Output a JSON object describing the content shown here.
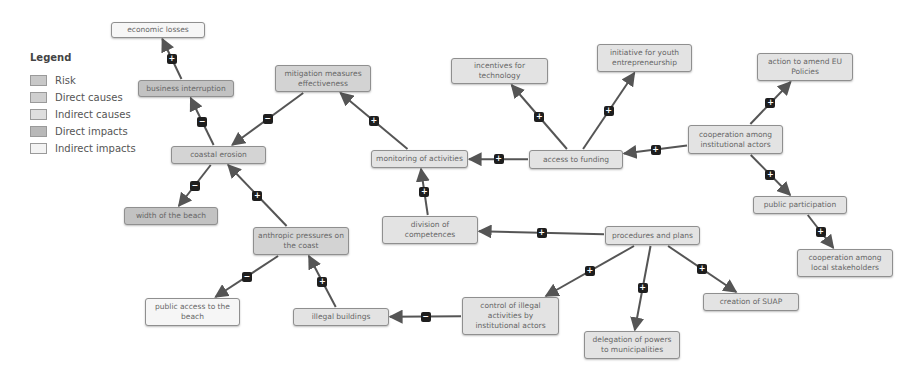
{
  "legend": {
    "title": "Legend",
    "items": [
      {
        "label": "Risk",
        "color": "#c8c8c8"
      },
      {
        "label": "Direct causes",
        "color": "#cfcfcf"
      },
      {
        "label": "Indirect causes",
        "color": "#dedede"
      },
      {
        "label": "Direct impacts",
        "color": "#b8b8b8"
      },
      {
        "label": "Indirect impacts",
        "color": "#f3f3f3"
      }
    ]
  },
  "nodes": {
    "economic_losses": {
      "label": "economic losses",
      "category": "Indirect impacts"
    },
    "business_interruption": {
      "label": "business interruption",
      "category": "Direct impacts"
    },
    "coastal_erosion": {
      "label": "coastal erosion",
      "category": "Risk"
    },
    "width_of_the_beach": {
      "label": "width of the beach",
      "category": "Direct impacts"
    },
    "mitigation_measures_effectiveness": {
      "label": "mitigation measures effectiveness",
      "category": "Direct causes"
    },
    "anthropic_pressures": {
      "label": "anthropic pressures on the coast",
      "category": "Direct causes"
    },
    "public_access_to_the_beach": {
      "label": "public access to the beach",
      "category": "Indirect impacts"
    },
    "illegal_buildings": {
      "label": "illegal buildings",
      "category": "Indirect causes"
    },
    "monitoring_of_activities": {
      "label": "monitoring of activities",
      "category": "Indirect causes"
    },
    "division_of_competences": {
      "label": "division of competences",
      "category": "Indirect causes"
    },
    "access_to_funding": {
      "label": "access to funding",
      "category": "Indirect causes"
    },
    "incentives_for_technology": {
      "label": "incentives for technology",
      "category": "Indirect causes"
    },
    "initiative_for_youth": {
      "label": "initiative for youth entrepreneurship",
      "category": "Indirect causes"
    },
    "cooperation_institutional": {
      "label": "cooperation among institutional actors",
      "category": "Indirect causes"
    },
    "action_to_amend_eu": {
      "label": "action to amend EU Policies",
      "category": "Indirect causes"
    },
    "public_participation": {
      "label": "public participation",
      "category": "Indirect causes"
    },
    "cooperation_local": {
      "label": "cooperation among local stakeholders",
      "category": "Indirect causes"
    },
    "procedures_and_plans": {
      "label": "procedures and plans",
      "category": "Indirect causes"
    },
    "control_of_illegal": {
      "label": "control of illegal activities by institutional actors",
      "category": "Indirect causes"
    },
    "delegation_of_powers": {
      "label": "delegation of powers to municipalities",
      "category": "Indirect causes"
    },
    "creation_of_suap": {
      "label": "creation of SUAP",
      "category": "Indirect causes"
    }
  },
  "edges": [
    {
      "from": "business_interruption",
      "to": "economic_losses",
      "sign": "+"
    },
    {
      "from": "coastal_erosion",
      "to": "business_interruption",
      "sign": "−"
    },
    {
      "from": "coastal_erosion",
      "to": "width_of_the_beach",
      "sign": "−"
    },
    {
      "from": "mitigation_measures_effectiveness",
      "to": "coastal_erosion",
      "sign": "−"
    },
    {
      "from": "anthropic_pressures",
      "to": "coastal_erosion",
      "sign": "+"
    },
    {
      "from": "anthropic_pressures",
      "to": "public_access_to_the_beach",
      "sign": "−"
    },
    {
      "from": "illegal_buildings",
      "to": "anthropic_pressures",
      "sign": "+"
    },
    {
      "from": "monitoring_of_activities",
      "to": "mitigation_measures_effectiveness",
      "sign": "+"
    },
    {
      "from": "division_of_competences",
      "to": "monitoring_of_activities",
      "sign": "+"
    },
    {
      "from": "access_to_funding",
      "to": "monitoring_of_activities",
      "sign": "+"
    },
    {
      "from": "access_to_funding",
      "to": "incentives_for_technology",
      "sign": "+"
    },
    {
      "from": "access_to_funding",
      "to": "initiative_for_youth",
      "sign": "+"
    },
    {
      "from": "cooperation_institutional",
      "to": "access_to_funding",
      "sign": "+"
    },
    {
      "from": "cooperation_institutional",
      "to": "action_to_amend_eu",
      "sign": "+"
    },
    {
      "from": "cooperation_institutional",
      "to": "public_participation",
      "sign": "+"
    },
    {
      "from": "public_participation",
      "to": "cooperation_local",
      "sign": "+"
    },
    {
      "from": "procedures_and_plans",
      "to": "division_of_competences",
      "sign": "+"
    },
    {
      "from": "procedures_and_plans",
      "to": "control_of_illegal",
      "sign": "+"
    },
    {
      "from": "procedures_and_plans",
      "to": "delegation_of_powers",
      "sign": "+"
    },
    {
      "from": "procedures_and_plans",
      "to": "creation_of_suap",
      "sign": "+"
    },
    {
      "from": "control_of_illegal",
      "to": "illegal_buildings",
      "sign": "−"
    }
  ]
}
